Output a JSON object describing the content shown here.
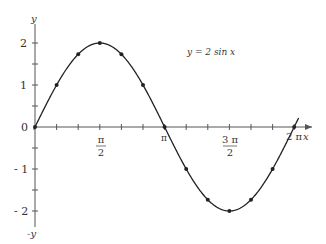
{
  "chart_data": {
    "type": "line",
    "title": "y = 2 sin x",
    "function": "2*sin(x)",
    "xlabel": "x",
    "ylabel": "y",
    "ylabel_negative": "-y",
    "xlim": [
      0,
      6.2832
    ],
    "ylim": [
      -2,
      2
    ],
    "grid": false,
    "legend": "none",
    "x_ticks": [
      {
        "value": 1.5708,
        "label_num": "π",
        "label_den": "2"
      },
      {
        "value": 3.1416,
        "label": "π"
      },
      {
        "value": 4.7124,
        "label_num": "3 π",
        "label_den": "2"
      },
      {
        "value": 6.2832,
        "label": "2 π"
      }
    ],
    "y_ticks": [
      {
        "value": 2,
        "label": "2"
      },
      {
        "value": 1,
        "label": "1"
      },
      {
        "value": 0,
        "label": "0"
      },
      {
        "value": -1,
        "label": "- 1"
      },
      {
        "value": -2,
        "label": "- 2"
      }
    ],
    "points": {
      "x": [
        0,
        0.5236,
        1.0472,
        1.5708,
        2.0944,
        2.618,
        3.1416,
        3.6652,
        4.1888,
        4.7124,
        5.236,
        5.7596,
        6.2832
      ],
      "y": [
        0,
        1,
        1.732,
        2,
        1.732,
        1,
        0,
        -1,
        -1.732,
        -2,
        -1.732,
        -1,
        0
      ]
    },
    "series": [
      {
        "name": "y = 2 sin x",
        "values": [
          0,
          1,
          1.732,
          2,
          1.732,
          1,
          0,
          -1,
          -1.732,
          -2,
          -1.732,
          -1,
          0
        ]
      }
    ]
  },
  "labels": {
    "equation": "y = 2 sin x",
    "x_axis": "x",
    "y_axis": "y",
    "y_axis_neg": "-y",
    "origin": "0",
    "pi": "π",
    "pi_half_num": "π",
    "pi_half_den": "2",
    "three_pi_half_num": "3 π",
    "three_pi_half_den": "2",
    "two_pi": "2 π",
    "y2": "2",
    "y1": "1",
    "ym1": "- 1",
    "ym2": "- 2"
  },
  "colors": {
    "curve": "#222222",
    "axis": "#555555",
    "text": "#333333"
  }
}
